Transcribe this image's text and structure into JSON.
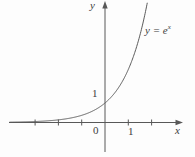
{
  "figure": {
    "background": "#fdfdfd",
    "line_color": "#585858",
    "text_color": "#3c3c3c"
  },
  "chart_data": {
    "type": "line",
    "title": "",
    "xlabel": "x",
    "ylabel": "y",
    "origin_label": "0",
    "curve_label": {
      "base": "y = e",
      "exponent": "x"
    },
    "function": "y = exp(x)",
    "x_range": [
      -4.1,
      1.815
    ],
    "x_ticks": [
      -3,
      -2,
      -1,
      1,
      2
    ],
    "x_tick_label_value": "1",
    "y_ticks": [
      1
    ],
    "y_tick_label_value": "1",
    "grid": false,
    "legend": "none",
    "points": [
      {
        "x": -4.0,
        "y": 0.02
      },
      {
        "x": -3.5,
        "y": 0.03
      },
      {
        "x": -3.0,
        "y": 0.05
      },
      {
        "x": -2.5,
        "y": 0.08
      },
      {
        "x": -2.0,
        "y": 0.14
      },
      {
        "x": -1.5,
        "y": 0.22
      },
      {
        "x": -1.0,
        "y": 0.37
      },
      {
        "x": -0.5,
        "y": 0.61
      },
      {
        "x": 0.0,
        "y": 1.0
      },
      {
        "x": 0.5,
        "y": 1.65
      },
      {
        "x": 1.0,
        "y": 2.72
      },
      {
        "x": 1.5,
        "y": 4.48
      },
      {
        "x": 1.8,
        "y": 6.05
      }
    ]
  }
}
